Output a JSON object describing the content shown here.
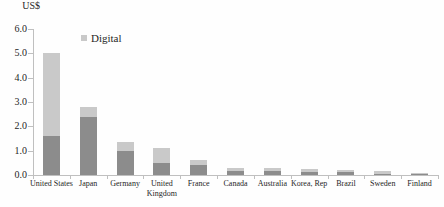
{
  "chart_data": {
    "type": "bar",
    "stacked": true,
    "title": "",
    "ylabel": "US$",
    "xlabel": "",
    "categories": [
      "United States",
      "Japan",
      "Germany",
      "United Kingdom",
      "France",
      "Canada",
      "Australia",
      "Korea, Rep",
      "Brazil",
      "Sweden",
      "Finland"
    ],
    "series": [
      {
        "name": "",
        "color": "#8c8c8c",
        "values": [
          1.6,
          2.4,
          1.0,
          0.5,
          0.4,
          0.17,
          0.17,
          0.13,
          0.12,
          0.06,
          0.03
        ]
      },
      {
        "name": "Digital",
        "color": "#c9c9c9",
        "values": [
          3.4,
          0.4,
          0.35,
          0.6,
          0.2,
          0.13,
          0.13,
          0.12,
          0.08,
          0.09,
          0.05
        ]
      }
    ],
    "totals": [
      5.0,
      2.8,
      1.35,
      1.1,
      0.6,
      0.3,
      0.3,
      0.25,
      0.2,
      0.15,
      0.08
    ],
    "ylim": [
      0,
      6
    ],
    "ytick_step": 1.0,
    "ytick_labels": [
      "0.0",
      "1.0",
      "2.0",
      "3.0",
      "4.0",
      "5.0",
      "6.0"
    ],
    "grid": false,
    "legend": {
      "position": "top-center",
      "entries": [
        {
          "label": "Digital",
          "color": "#c9c9c9"
        }
      ]
    },
    "colors": {
      "axis": "#bfbfbf",
      "text": "#262626",
      "background": "#fefefe"
    }
  }
}
